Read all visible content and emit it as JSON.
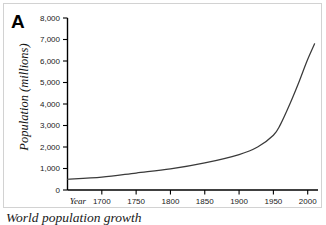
{
  "figure": {
    "panel_label": "A",
    "caption": "World population growth",
    "border_color": "#d2d2d2",
    "background": "#ffffff"
  },
  "chart_data": {
    "type": "line",
    "title": "",
    "subtitle": "",
    "xlabel": "Year",
    "ylabel": "Population (millions)",
    "xlim": [
      1650,
      2015
    ],
    "ylim": [
      0,
      8000
    ],
    "grid": false,
    "legend": null,
    "line_color": "#3a3a3a",
    "x_ticks": [
      1700,
      1750,
      1800,
      1850,
      1900,
      1950,
      2000
    ],
    "x_tick_labels": [
      "1700",
      "1750",
      "1800",
      "1850",
      "1900",
      "1950",
      "2000"
    ],
    "y_ticks": [
      0,
      1000,
      2000,
      3000,
      4000,
      5000,
      6000,
      7000,
      8000
    ],
    "y_tick_labels": [
      "0",
      "1,000",
      "2,000",
      "3,000",
      "4,000",
      "5,000",
      "6,000",
      "7,000",
      "8,000"
    ],
    "series": [
      {
        "name": "World population",
        "x": [
          1650,
          1700,
          1750,
          1800,
          1850,
          1900,
          1927,
          1950,
          1960,
          1974,
          1987,
          1999,
          2010
        ],
        "values": [
          500,
          600,
          790,
          980,
          1260,
          1650,
          2000,
          2550,
          3030,
          4000,
          5000,
          6000,
          6800
        ]
      }
    ]
  }
}
